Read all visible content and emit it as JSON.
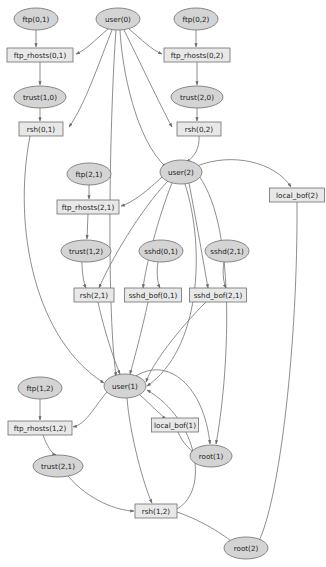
{
  "diagram": {
    "type": "directed-graph",
    "node_shapes": {
      "ellipse": "privilege/condition node",
      "rect": "exploit/action node"
    },
    "colors": {
      "ellipse_fill": "#d4d4d4",
      "rect_fill": "#e8e8e8",
      "stroke": "#6e6e6e",
      "edge": "#7a7a7a",
      "text": "#1a1a1a"
    },
    "nodes": [
      {
        "id": "ftp_0_1",
        "label": "ftp(0,1)",
        "shape": "ellipse",
        "cx": 36,
        "cy": 19,
        "rx": 22,
        "ry": 11
      },
      {
        "id": "user_0",
        "label": "user(0)",
        "shape": "ellipse",
        "cx": 118,
        "cy": 19,
        "rx": 22,
        "ry": 11
      },
      {
        "id": "ftp_0_2",
        "label": "ftp(0,2)",
        "shape": "ellipse",
        "cx": 196,
        "cy": 19,
        "rx": 22,
        "ry": 11
      },
      {
        "id": "ftp_rhosts_0_1",
        "label": "ftp_rhosts(0,1)",
        "shape": "rect",
        "cx": 40,
        "cy": 55,
        "w": 66,
        "h": 14
      },
      {
        "id": "ftp_rhosts_0_2",
        "label": "ftp_rhosts(0,2)",
        "shape": "rect",
        "cx": 197,
        "cy": 55,
        "w": 66,
        "h": 14
      },
      {
        "id": "trust_1_0",
        "label": "trust(1,0)",
        "shape": "ellipse",
        "cx": 40,
        "cy": 97,
        "rx": 26,
        "ry": 11
      },
      {
        "id": "trust_2_0",
        "label": "trust(2,0)",
        "shape": "ellipse",
        "cx": 197,
        "cy": 97,
        "rx": 26,
        "ry": 11
      },
      {
        "id": "rsh_0_1",
        "label": "rsh(0,1)",
        "shape": "rect",
        "cx": 41,
        "cy": 129,
        "w": 44,
        "h": 14
      },
      {
        "id": "rsh_0_2",
        "label": "rsh(0,2)",
        "shape": "rect",
        "cx": 199,
        "cy": 129,
        "w": 44,
        "h": 14
      },
      {
        "id": "ftp_2_1",
        "label": "ftp(2,1)",
        "shape": "ellipse",
        "cx": 89,
        "cy": 174,
        "rx": 22,
        "ry": 11
      },
      {
        "id": "user_2",
        "label": "user(2)",
        "shape": "ellipse",
        "cx": 181,
        "cy": 172,
        "rx": 21,
        "ry": 12
      },
      {
        "id": "local_bof_2",
        "label": "local_bof(2)",
        "shape": "rect",
        "cx": 297,
        "cy": 195,
        "w": 55,
        "h": 14
      },
      {
        "id": "ftp_rhosts_2_1",
        "label": "ftp_rhosts(2,1)",
        "shape": "rect",
        "cx": 88,
        "cy": 207,
        "w": 62,
        "h": 14
      },
      {
        "id": "trust_1_2",
        "label": "trust(1,2)",
        "shape": "ellipse",
        "cx": 86,
        "cy": 251,
        "rx": 25,
        "ry": 11
      },
      {
        "id": "sshd_0_1",
        "label": "sshd(0,1)",
        "shape": "ellipse",
        "cx": 161,
        "cy": 251,
        "rx": 22,
        "ry": 11
      },
      {
        "id": "sshd_2_1",
        "label": "sshd(2,1)",
        "shape": "ellipse",
        "cx": 227,
        "cy": 251,
        "rx": 22,
        "ry": 11
      },
      {
        "id": "rsh_2_1",
        "label": "rsh(2,1)",
        "shape": "rect",
        "cx": 94,
        "cy": 295,
        "w": 40,
        "h": 14
      },
      {
        "id": "sshd_bof_0_1",
        "label": "sshd_bof(0,1)",
        "shape": "rect",
        "cx": 153,
        "cy": 295,
        "w": 57,
        "h": 14
      },
      {
        "id": "sshd_bof_2_1",
        "label": "sshd_bof(2,1)",
        "shape": "rect",
        "cx": 218,
        "cy": 295,
        "w": 57,
        "h": 14
      },
      {
        "id": "ftp_1_2",
        "label": "ftp(1,2)",
        "shape": "ellipse",
        "cx": 40,
        "cy": 388,
        "rx": 22,
        "ry": 11
      },
      {
        "id": "user_1",
        "label": "user(1)",
        "shape": "ellipse",
        "cx": 125,
        "cy": 386,
        "rx": 21,
        "ry": 12
      },
      {
        "id": "ftp_rhosts_1_2",
        "label": "ftp_rhosts(1,2)",
        "shape": "rect",
        "cx": 40,
        "cy": 428,
        "w": 64,
        "h": 14
      },
      {
        "id": "local_bof_1",
        "label": "local_bof(1)",
        "shape": "rect",
        "cx": 175,
        "cy": 425,
        "w": 47,
        "h": 14
      },
      {
        "id": "trust_2_1",
        "label": "trust(2,1)",
        "shape": "ellipse",
        "cx": 58,
        "cy": 466,
        "rx": 25,
        "ry": 11
      },
      {
        "id": "root_1",
        "label": "root(1)",
        "shape": "ellipse",
        "cx": 211,
        "cy": 456,
        "rx": 21,
        "ry": 11
      },
      {
        "id": "rsh_1_2",
        "label": "rsh(1,2)",
        "shape": "rect",
        "cx": 156,
        "cy": 511,
        "w": 42,
        "h": 14
      },
      {
        "id": "root_2",
        "label": "root(2)",
        "shape": "ellipse",
        "cx": 246,
        "cy": 548,
        "rx": 22,
        "ry": 11
      }
    ],
    "edges": [
      {
        "from": "ftp_0_1",
        "to": "ftp_rhosts_0_1",
        "d": "M36,30 L36,47"
      },
      {
        "from": "user_0",
        "to": "ftp_rhosts_0_1",
        "d": "M108,29 C95,40 86,50 76,54"
      },
      {
        "from": "user_0",
        "to": "ftp_rhosts_0_2",
        "d": "M129,29 C142,40 152,50 162,54"
      },
      {
        "from": "ftp_0_2",
        "to": "ftp_rhosts_0_2",
        "d": "M196,30 L196,47"
      },
      {
        "from": "ftp_rhosts_0_1",
        "to": "trust_1_0",
        "d": "M40,62 L40,85"
      },
      {
        "from": "ftp_rhosts_0_2",
        "to": "trust_2_0",
        "d": "M197,62 L197,85"
      },
      {
        "from": "trust_1_0",
        "to": "rsh_0_1",
        "d": "M40,108 L40,121"
      },
      {
        "from": "trust_2_0",
        "to": "rsh_0_2",
        "d": "M197,108 L197,121"
      },
      {
        "from": "user_0",
        "to": "rsh_0_1",
        "d": "M112,30 C100,60 85,105 69,127"
      },
      {
        "from": "user_0",
        "to": "rsh_0_2",
        "d": "M124,30 C140,62 160,105 172,127"
      },
      {
        "from": "user_0",
        "to": "user_2",
        "d": "M120,30 C122,70 136,140 166,167"
      },
      {
        "from": "rsh_0_2",
        "to": "user_2",
        "d": "M199,136 C200,148 194,158 186,162"
      },
      {
        "from": "user_2",
        "to": "ftp_rhosts_2_1",
        "d": "M162,177 C148,190 134,202 121,206"
      },
      {
        "from": "ftp_2_1",
        "to": "ftp_rhosts_2_1",
        "d": "M89,185 L89,199"
      },
      {
        "from": "ftp_rhosts_2_1",
        "to": "trust_1_2",
        "d": "M88,214 L87,239"
      },
      {
        "from": "trust_1_2",
        "to": "rsh_2_1",
        "d": "M82,262 C82,274 84,284 86,288"
      },
      {
        "from": "user_2",
        "to": "rsh_2_1",
        "d": "M168,181 C140,210 110,262 99,288"
      },
      {
        "from": "user_2",
        "to": "sshd_bof_0_1",
        "d": "M172,183 C158,218 146,265 143,288"
      },
      {
        "from": "sshd_0_1",
        "to": "sshd_bof_0_1",
        "d": "M158,262 C156,274 158,284 160,288"
      },
      {
        "from": "user_2",
        "to": "sshd_bof_2_1",
        "d": "M189,183 C196,220 204,265 208,288"
      },
      {
        "from": "sshd_2_1",
        "to": "sshd_bof_2_1",
        "d": "M224,262 C222,274 224,284 226,288"
      },
      {
        "from": "user_2",
        "to": "local_bof_2",
        "d": "M197,166 C232,152 275,162 291,187"
      },
      {
        "from": "user_0",
        "to": "user_1",
        "d": "M116,30 C110,110 106,300 116,376"
      },
      {
        "from": "rsh_0_1",
        "to": "user_1",
        "d": "M30,136 C12,230 36,340 104,383"
      },
      {
        "from": "rsh_2_1",
        "to": "user_1",
        "d": "M98,302 C104,330 114,360 120,374"
      },
      {
        "from": "sshd_bof_0_1",
        "to": "user_1",
        "d": "M148,302 C142,330 134,360 130,374"
      },
      {
        "from": "sshd_bof_2_1",
        "to": "user_1",
        "d": "M206,302 C178,330 152,364 146,382"
      },
      {
        "from": "user_2",
        "to": "user_1",
        "d": "M185,184 C206,250 200,350 147,386"
      },
      {
        "from": "user_1",
        "to": "ftp_rhosts_1_2",
        "d": "M107,392 C92,410 86,424 73,427"
      },
      {
        "from": "ftp_1_2",
        "to": "ftp_rhosts_1_2",
        "d": "M40,399 L40,420"
      },
      {
        "from": "ftp_rhosts_1_2",
        "to": "trust_2_1",
        "d": "M43,435 C47,446 52,454 56,455"
      },
      {
        "from": "user_1",
        "to": "local_bof_1",
        "d": "M139,394 C152,406 162,416 166,419"
      },
      {
        "from": "local_bof_1",
        "to": "root_1",
        "d": "M178,432 C182,442 190,450 195,453"
      },
      {
        "from": "user_1",
        "to": "root_1",
        "d": "M136,376 C168,356 204,386 210,444"
      },
      {
        "from": "user_1",
        "to": "rsh_1_2",
        "d": "M127,398 C130,436 144,486 152,503"
      },
      {
        "from": "trust_2_1",
        "to": "rsh_1_2",
        "d": "M68,476 C88,500 118,511 134,511"
      },
      {
        "from": "rsh_1_2",
        "to": "user_1",
        "d": "M177,509 C210,490 198,420 147,390"
      },
      {
        "from": "user_2",
        "to": "root_1",
        "d": "M199,176 C238,230 228,380 216,444"
      },
      {
        "from": "local_bof_2",
        "to": "root_2",
        "d": "M297,202 C298,340 280,500 258,543"
      },
      {
        "from": "rsh_1_2",
        "to": "root_2",
        "d": "M177,512 C206,522 228,538 236,545"
      }
    ]
  }
}
